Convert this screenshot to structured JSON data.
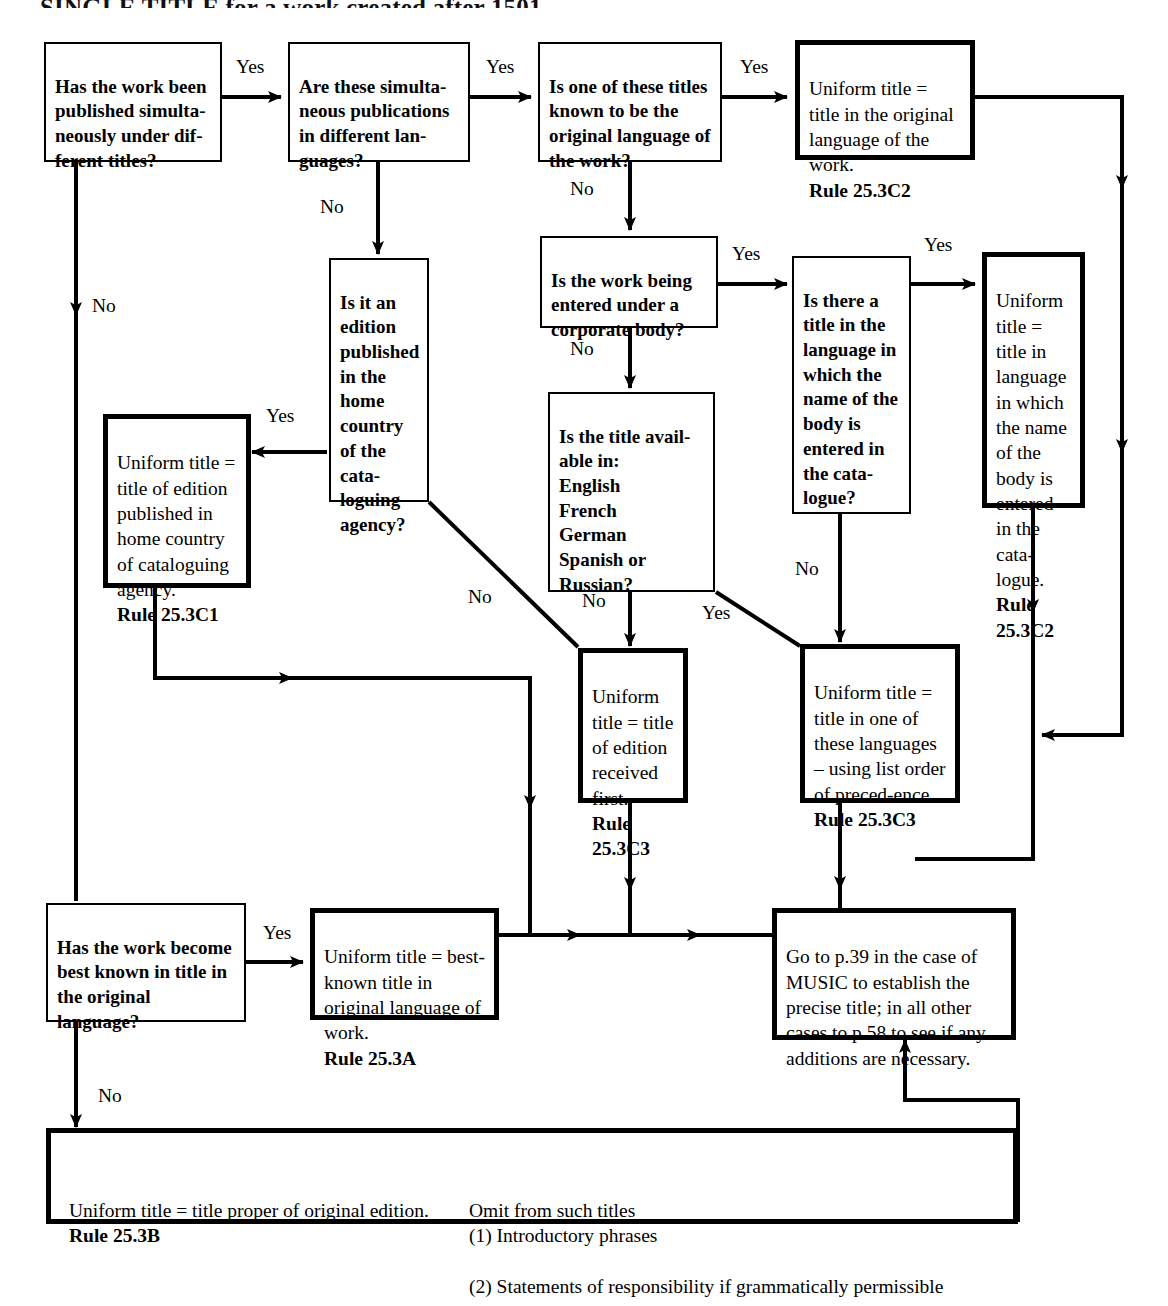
{
  "page": {
    "title_partial": "SINGLE TITLE for a work created after 1501"
  },
  "nodes": {
    "q_simultaneous": {
      "text": "Has the work been published simulta-neously under dif-ferent titles?",
      "kind": "question"
    },
    "q_languages": {
      "text": "Are these simulta-neous publications in different lan-guages?",
      "kind": "question"
    },
    "q_original_lang": {
      "text": "Is one of these titles known to be the original language of the work?",
      "kind": "question"
    },
    "a_original_lang": {
      "text": "Uniform title = title in the original language of the work.",
      "rule": "Rule 25.3C2",
      "kind": "answer"
    },
    "q_home_country": {
      "text": "Is it an edition published in the home country of the cata-loguing agency?",
      "kind": "question"
    },
    "a_home_country": {
      "text": "Uniform title = title of edition published in home country of cataloguing agency.",
      "rule": "Rule 25.3C1",
      "kind": "answer"
    },
    "q_corporate_body": {
      "text": "Is the work being entered under a corporate body?",
      "kind": "question"
    },
    "q_body_language": {
      "text": "Is there a title in the language in which the name of the body is entered in the cata-logue?",
      "kind": "question"
    },
    "a_body_language": {
      "text": "Uniform title = title in language in which the name of the body is entered in the cata-logue.",
      "rule": "Rule 25.3C2",
      "kind": "answer"
    },
    "q_title_available": {
      "text": "Is the title avail-able in:\nEnglish\nFrench\nGerman\nSpanish or\nRussian?",
      "kind": "question"
    },
    "a_received_first": {
      "text": "Uniform title = title of edition received first.",
      "rule": "Rule 25.3C3",
      "kind": "answer"
    },
    "a_list_order": {
      "text": "Uniform title = title in one of these languages – using list order of preced-ence.",
      "rule": "Rule 25.3C3",
      "kind": "answer"
    },
    "q_best_known": {
      "text": "Has the work become best known in title in the original language?",
      "kind": "question"
    },
    "a_best_known": {
      "text": "Uniform  title = best-known title in original language of work.",
      "rule": "Rule 25.3A",
      "kind": "answer"
    },
    "a_goto_p39": {
      "text": "Go to p.39 in the case of MUSIC to establish the precise title; in all other cases to p.58 to see if any additions are necessary.",
      "kind": "answer"
    },
    "a_title_proper": {
      "text": "Uniform title = title proper of original edition.",
      "rule": "Rule 25.3B",
      "omit_heading": "Omit from such titles",
      "omit_1": "(1) Introductory phrases",
      "omit_2": "(2) Statements of responsibility if grammatically permissible",
      "kind": "answer"
    }
  },
  "edge_labels": {
    "yes_1": "Yes",
    "yes_2": "Yes",
    "yes_3": "Yes",
    "yes_home": "Yes",
    "yes_corp": "Yes",
    "yes_body": "Yes",
    "yes_langlist": "Yes",
    "yes_best_known": "Yes",
    "no_simultaneous": "No",
    "no_languages": "No",
    "no_original_lang": "No",
    "no_corporate": "No",
    "no_home_country": "No",
    "no_title_available": "No",
    "no_body_language": "No",
    "no_best_known": "No"
  },
  "colors": {
    "ink": "#000000",
    "paper": "#ffffff"
  }
}
